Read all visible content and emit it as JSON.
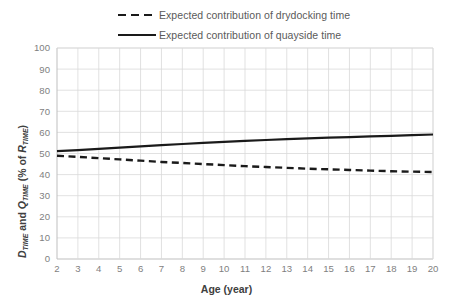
{
  "chart_data": {
    "type": "line",
    "title": "",
    "xlabel": "Age (year)",
    "ylabel": "D_TIME and Q_TIME (% of R_TIME)",
    "ylabel_parts": {
      "d": "D",
      "sub_time_1": "TIME",
      "and": " and ",
      "q": "Q",
      "sub_time_2": "TIME",
      "mid": " (% of ",
      "r": "R",
      "sub_time_3": "TIME",
      "close": ")"
    },
    "x": [
      2,
      3,
      4,
      5,
      6,
      7,
      8,
      9,
      10,
      11,
      12,
      13,
      14,
      15,
      16,
      17,
      18,
      19,
      20
    ],
    "xticklabels": [
      "2",
      "3",
      "4",
      "5",
      "6",
      "7",
      "8",
      "9",
      "10",
      "11",
      "12",
      "13",
      "14",
      "15",
      "16",
      "17",
      "18",
      "19",
      "20"
    ],
    "yticklabels": [
      "0",
      "10",
      "20",
      "30",
      "40",
      "50",
      "60",
      "70",
      "80",
      "90",
      "100"
    ],
    "yticks": [
      0,
      10,
      20,
      30,
      40,
      50,
      60,
      70,
      80,
      90,
      100
    ],
    "xlim": [
      2,
      20
    ],
    "ylim": [
      0,
      100
    ],
    "grid": true,
    "legend_position": "top",
    "series": [
      {
        "name": "Expected contribution of drydocking time",
        "style": "dashed",
        "color": "#1a1a1a",
        "values": [
          48.9,
          48.4,
          47.8,
          47.2,
          46.6,
          46.0,
          45.5,
          45.0,
          44.5,
          44.0,
          43.6,
          43.2,
          42.8,
          42.5,
          42.2,
          41.9,
          41.6,
          41.4,
          41.2
        ]
      },
      {
        "name": "Expected contribution of quayside time",
        "style": "solid",
        "color": "#1a1a1a",
        "values": [
          51.1,
          51.6,
          52.2,
          52.8,
          53.4,
          54.0,
          54.5,
          55.0,
          55.5,
          56.0,
          56.4,
          56.8,
          57.2,
          57.5,
          57.8,
          58.1,
          58.4,
          58.7,
          59.0
        ]
      }
    ]
  },
  "legend": {
    "items": [
      {
        "label": "Expected contribution of drydocking time",
        "style": "dashed"
      },
      {
        "label": "Expected contribution of quayside time",
        "style": "solid"
      }
    ]
  }
}
